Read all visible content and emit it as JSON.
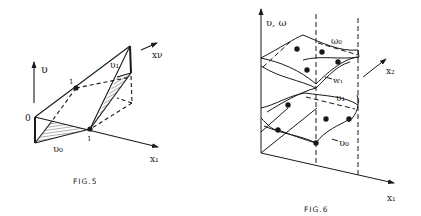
{
  "figures": [
    {
      "id": "fig5",
      "caption": "FIG.5",
      "labels": {
        "v_axis": "υ",
        "x_nu_axis": "xν",
        "x1_axis": "x₁",
        "origin": "0",
        "point_upper": "1",
        "point_lower": "1",
        "v1": "υ₁",
        "v0": "υ₀"
      }
    },
    {
      "id": "fig6",
      "caption": "FIG.6",
      "labels": {
        "vertical_axis": "υ, ω",
        "x2_axis": "x₂",
        "x1_axis": "x₁",
        "w0": "ω₀",
        "w1": "w₁",
        "v1": "υ₁",
        "v0": "υ₀"
      }
    }
  ],
  "colors": {
    "ink": "#1a1a1a",
    "background": "#ffffff"
  }
}
